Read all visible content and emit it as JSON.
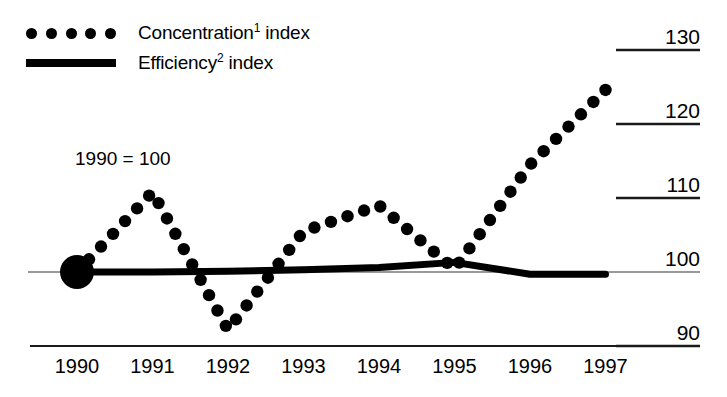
{
  "chart_data": {
    "type": "line",
    "title": "",
    "subtitle": "",
    "xlabel": "",
    "ylabel": "",
    "annotation": "1990 = 100",
    "base_year": "1990",
    "base_value": 100,
    "grid": true,
    "grid_side": "right",
    "legend_position": "top-left",
    "x": [
      1990,
      1991,
      1992,
      1993,
      1994,
      1995,
      1996,
      1997
    ],
    "categories": [
      "1990",
      "1991",
      "1992",
      "1993",
      "1994",
      "1995",
      "1996",
      "1997"
    ],
    "xlim": [
      1990,
      1997
    ],
    "ylim": [
      88,
      132
    ],
    "yticks": [
      90,
      100,
      110,
      120,
      130
    ],
    "ytick_labels": [
      "90",
      "100",
      "110",
      "120",
      "130"
    ],
    "series": [
      {
        "name": "Concentration¹ index",
        "style": "dotted",
        "marker": "circle",
        "color": "#000000",
        "values": [
          100,
          110.8,
          92.2,
          105.5,
          109.0,
          100.4,
          114.5,
          124.6
        ]
      },
      {
        "name": "Efficiency² index",
        "style": "solid",
        "marker": "none",
        "color": "#000000",
        "values": [
          100,
          100.0,
          100.1,
          100.3,
          100.6,
          101.3,
          99.7,
          99.7
        ]
      }
    ],
    "markers": [
      {
        "name": "origin-marker",
        "x": 1990,
        "y": 100,
        "shape": "filled-circle",
        "radius": 17
      }
    ]
  },
  "legend": {
    "items": [
      {
        "label_main": "Concentration",
        "label_sup": "1",
        "label_tail": " index",
        "swatch": "dotted-line"
      },
      {
        "label_main": "Efficiency",
        "label_sup": "2",
        "label_tail": " index",
        "swatch": "solid-line"
      }
    ]
  },
  "axes": {
    "y_labels": [
      "130",
      "120",
      "110",
      "100",
      "90"
    ],
    "x_labels": [
      "1990",
      "1991",
      "1992",
      "1993",
      "1994",
      "1995",
      "1996",
      "1997"
    ]
  },
  "colors": {
    "ink": "#000000",
    "background": "#ffffff",
    "gridline": "#1a1a1a",
    "baseline": "#777777"
  }
}
